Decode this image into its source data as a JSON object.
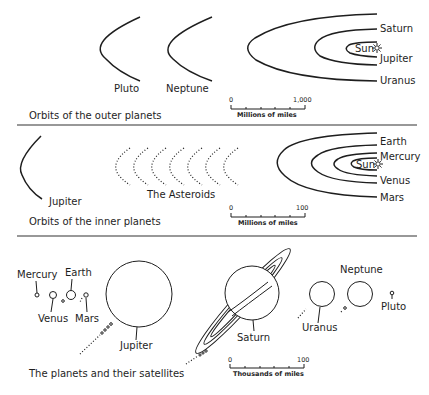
{
  "sections": {
    "outer": {
      "caption": "Orbits of the outer planets",
      "orbit_labels": {
        "pluto": "Pluto",
        "neptune": "Neptune",
        "saturn": "Saturn",
        "sun": "Sun",
        "jupiter": "Jupiter",
        "uranus": "Uranus"
      },
      "scale": {
        "start": "0",
        "end": "1,000",
        "unit": "Millions of miles"
      }
    },
    "inner": {
      "caption": "Orbits of the inner planets",
      "orbit_labels": {
        "jupiter": "Jupiter",
        "asteroids": "The Asteroids",
        "earth": "Earth",
        "mercury": "Mercury",
        "sun": "Sun",
        "venus": "Venus",
        "mars": "Mars"
      },
      "scale": {
        "start": "0",
        "end": "100",
        "unit": "Millions of miles"
      }
    },
    "planets": {
      "caption": "The planets and their satellites",
      "planet_labels": {
        "mercury": "Mercury",
        "earth": "Earth",
        "venus": "Venus",
        "mars": "Mars",
        "jupiter": "Jupiter",
        "saturn": "Saturn",
        "uranus": "Uranus",
        "neptune": "Neptune",
        "pluto": "Pluto"
      },
      "scale": {
        "start": "0",
        "end": "100",
        "unit": "Thousands of miles"
      }
    }
  },
  "icons": {
    "sun": "sun-icon"
  },
  "colors": {
    "ink": "#1e1e1e",
    "background": "#ffffff"
  }
}
